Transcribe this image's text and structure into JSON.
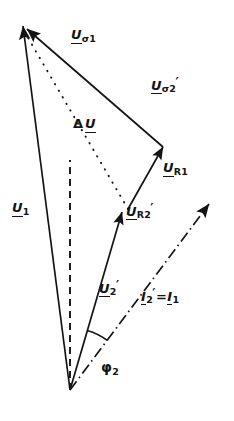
{
  "figure": {
    "kind": "phasor-vector-diagram",
    "title_visible": false,
    "background_color": "#ffffff",
    "stroke_color": "#141414",
    "width": 234,
    "height": 421
  },
  "labels": {
    "u_sigma1": {
      "symbol": "U",
      "subscript": "σ1",
      "prime": "",
      "text": "Uσ1"
    },
    "u_sigma2p": {
      "symbol": "U",
      "subscript": "σ2",
      "prime": "′",
      "text": "Uσ2′"
    },
    "delta_u": {
      "prefix": "Δ",
      "symbol": "U",
      "subscript": "",
      "prime": "",
      "text": "ΔU"
    },
    "u_r1": {
      "symbol": "U",
      "subscript": "R1",
      "prime": "",
      "text": "UR1"
    },
    "u_r2p": {
      "symbol": "U",
      "subscript": "R2",
      "prime": "′",
      "text": "UR2′"
    },
    "u_1": {
      "symbol": "U",
      "subscript": "1",
      "prime": "",
      "text": "U1"
    },
    "u_2p": {
      "symbol": "U",
      "subscript": "2",
      "prime": "′",
      "text": "U2′"
    },
    "i_2p_eq_i_1": {
      "symbol_a": "I",
      "subscript_a": "2",
      "prime_a": "′",
      "operator": "=",
      "symbol_b": "I",
      "subscript_b": "1",
      "text": "I2′ = I1"
    },
    "phi_2": {
      "symbol": "φ",
      "subscript": "2",
      "text": "φ2"
    }
  },
  "vectors": [
    {
      "name": "u_1",
      "style": "solid",
      "arrow": true,
      "x1": 70,
      "y1": 390,
      "x2": 23,
      "y2": 26
    },
    {
      "name": "u_sigma1",
      "style": "solid",
      "arrow": true,
      "x1": 163,
      "y1": 147,
      "x2": 23,
      "y2": 26
    },
    {
      "name": "u_sigma2p",
      "style": "solid",
      "arrow": true,
      "x1": 128,
      "y1": 209,
      "x2": 163,
      "y2": 147
    },
    {
      "name": "u_r2p",
      "style": "solid",
      "arrow": true,
      "x1": 70,
      "y1": 390,
      "x2": 122,
      "y2": 212
    },
    {
      "name": "delta_u",
      "style": "dotted",
      "arrow": false,
      "x1": 128,
      "y1": 209,
      "x2": 24,
      "y2": 30
    },
    {
      "name": "reference",
      "style": "dashed",
      "arrow": false,
      "x1": 70,
      "y1": 390,
      "x2": 70,
      "y2": 160
    },
    {
      "name": "i_2p",
      "style": "dashdot",
      "arrow": true,
      "x1": 70,
      "y1": 390,
      "x2": 213,
      "y2": 199
    }
  ],
  "angle_arcs": [
    {
      "name": "phi_2",
      "vertex_x": 70,
      "vertex_y": 390,
      "radius": 62,
      "from_deg": -73.8,
      "to_deg": -53.2
    }
  ],
  "label_positions": {
    "u_sigma1": {
      "x": 71,
      "y": 28
    },
    "u_sigma2p": {
      "x": 151,
      "y": 76
    },
    "delta_u": {
      "x": 73,
      "y": 117
    },
    "u_r1": {
      "x": 163,
      "y": 161
    },
    "u_r2p": {
      "x": 126,
      "y": 202
    },
    "u_1": {
      "x": 12,
      "y": 201
    },
    "u_2p": {
      "x": 99,
      "y": 279
    },
    "i_2p_eq_i_1": {
      "x": 141,
      "y": 287
    },
    "phi_2": {
      "x": 101,
      "y": 360
    }
  }
}
